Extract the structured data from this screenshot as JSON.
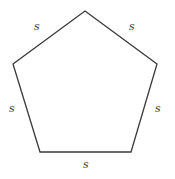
{
  "figure": {
    "type": "polygon",
    "shape_name": "regular-pentagon",
    "background_color": "#ffffff",
    "stroke_color": "#3a3a3a",
    "stroke_width": 1.3,
    "fill_color": "none",
    "vertices": [
      {
        "name": "apex",
        "x": 85,
        "y": 11
      },
      {
        "name": "upper-right",
        "x": 157,
        "y": 64
      },
      {
        "name": "lower-right",
        "x": 131,
        "y": 152
      },
      {
        "name": "lower-left",
        "x": 40,
        "y": 152
      },
      {
        "name": "upper-left",
        "x": 13,
        "y": 64
      }
    ],
    "side_labels": [
      {
        "id": "top-left",
        "text": "s",
        "x": 34,
        "y": 21
      },
      {
        "id": "top-right",
        "text": "s",
        "x": 129,
        "y": 21
      },
      {
        "id": "left",
        "text": "s",
        "x": 9,
        "y": 103
      },
      {
        "id": "right",
        "text": "s",
        "x": 155,
        "y": 103
      },
      {
        "id": "bottom",
        "text": "s",
        "x": 83,
        "y": 159
      }
    ]
  }
}
